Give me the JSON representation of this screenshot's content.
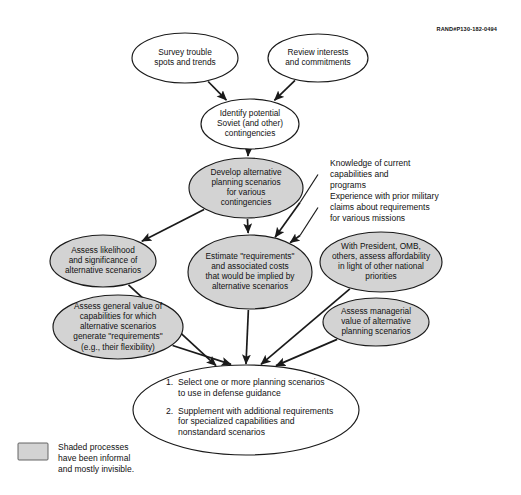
{
  "document": {
    "identifier": "RAND#P130-182-0494",
    "legend": {
      "swatch_color": "#d3d3d3",
      "lines": [
        "Shaded processes",
        "have been informal",
        "and mostly invisible."
      ]
    }
  },
  "colors": {
    "shaded_fill": "#d3d3d3",
    "unshaded_fill": "#ffffff",
    "stroke": "#1a1a1a",
    "text": "#111111",
    "background": "#ffffff"
  },
  "chart_data": {
    "type": "diagram",
    "nodes": [
      {
        "id": "survey-trouble-spots",
        "shaded": false,
        "cx": 185,
        "cy": 58,
        "rx": 53,
        "ry": 25,
        "lines": [
          "Survey trouble",
          "spots and trends"
        ]
      },
      {
        "id": "review-interests",
        "shaded": false,
        "cx": 318,
        "cy": 58,
        "rx": 50,
        "ry": 24,
        "lines": [
          "Review interests",
          "and commitments"
        ]
      },
      {
        "id": "identify-contingencies",
        "shaded": false,
        "cx": 250,
        "cy": 124,
        "rx": 49,
        "ry": 25,
        "lines": [
          "Identify potential",
          "Soviet (and other)",
          "contingencies"
        ]
      },
      {
        "id": "develop-scenarios",
        "shaded": true,
        "cx": 246,
        "cy": 188,
        "rx": 57,
        "ry": 30,
        "lines": [
          "Develop alternative",
          "planning scenarios",
          "for various",
          "contingencies"
        ]
      },
      {
        "id": "assess-likelihood",
        "shaded": true,
        "cx": 103,
        "cy": 261,
        "rx": 53,
        "ry": 26,
        "lines": [
          "Assess likelihood",
          "and significance of",
          "alternative scenarios"
        ]
      },
      {
        "id": "estimate-requirements",
        "shaded": true,
        "cx": 250,
        "cy": 272,
        "rx": 62,
        "ry": 37,
        "lines": [
          "Estimate \"requirements\"",
          "and associated costs",
          "that would be implied by",
          "alternative scenarios"
        ]
      },
      {
        "id": "assess-affordability",
        "shaded": true,
        "cx": 381,
        "cy": 262,
        "rx": 61,
        "ry": 30,
        "lines": [
          "With President, OMB,",
          "others, assess affordability",
          "in light of other national",
          "priorities"
        ]
      },
      {
        "id": "assess-general-value",
        "shaded": true,
        "cx": 118,
        "cy": 327,
        "rx": 65,
        "ry": 32,
        "lines": [
          "Assess general value of",
          "capabilities for which",
          "alternative scenarios",
          "generate \"requirements\"",
          "(e.g., their flexibility)"
        ]
      },
      {
        "id": "assess-managerial-value",
        "shaded": true,
        "cx": 376,
        "cy": 322,
        "rx": 53,
        "ry": 24,
        "lines": [
          "Assess managerial",
          "value of alternative",
          "planning scenarios"
        ]
      }
    ],
    "outcome_node": {
      "id": "select-scenarios",
      "shaded": false,
      "cx": 246,
      "cy": 410,
      "rx": 113,
      "ry": 45,
      "items": [
        {
          "number": "1.",
          "lines": [
            "Select one or more planning scenarios",
            "to use in defense guidance"
          ]
        },
        {
          "number": "2.",
          "lines": [
            "Supplement with additional requirements",
            "for specialized capabilities and",
            "nonstandard scenarios"
          ]
        }
      ]
    },
    "annotations": [
      {
        "id": "knowledge-of-current-capabilities",
        "x": 330,
        "y": 166,
        "lines": [
          "Knowledge of current",
          "capabilities and",
          "programs"
        ]
      },
      {
        "id": "experience-prior-military-claims",
        "x": 330,
        "y": 199,
        "lines": [
          "Experience with prior military",
          "claims about requirements",
          "for various missions"
        ]
      }
    ],
    "edges": [
      {
        "id": "survey-to-identify",
        "from": "survey-trouble-spots",
        "to": "identify-contingencies"
      },
      {
        "id": "review-to-identify",
        "from": "review-interests",
        "to": "identify-contingencies"
      },
      {
        "id": "identify-to-develop",
        "from": "identify-contingencies",
        "to": "develop-scenarios"
      },
      {
        "id": "develop-to-likelihood",
        "from": "develop-scenarios",
        "to": "assess-likelihood"
      },
      {
        "id": "develop-to-estimate",
        "from": "develop-scenarios",
        "to": "estimate-requirements"
      },
      {
        "id": "knowledge-to-estimate",
        "from": "knowledge-of-current-capabilities",
        "to": "estimate-requirements"
      },
      {
        "id": "experience-to-estimate",
        "from": "experience-prior-military-claims",
        "to": "estimate-requirements"
      },
      {
        "id": "likelihood-to-outcome",
        "from": "assess-likelihood",
        "to": "select-scenarios"
      },
      {
        "id": "general-value-to-outcome",
        "from": "assess-general-value",
        "to": "select-scenarios"
      },
      {
        "id": "estimate-to-outcome",
        "from": "estimate-requirements",
        "to": "select-scenarios"
      },
      {
        "id": "affordability-to-outcome",
        "from": "assess-affordability",
        "to": "select-scenarios"
      },
      {
        "id": "managerial-to-outcome",
        "from": "assess-managerial-value",
        "to": "select-scenarios"
      }
    ]
  }
}
